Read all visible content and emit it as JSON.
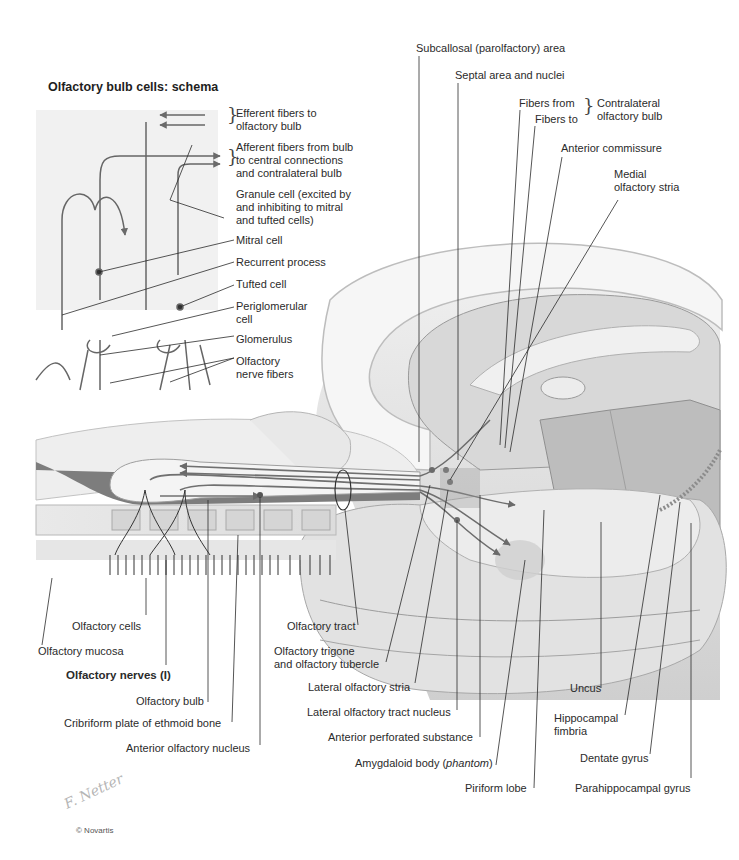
{
  "figure": {
    "inset_title": "Olfactory bulb cells: schema",
    "copyright": "© Novartis",
    "signature": "F. Netter",
    "colors": {
      "background": "#ffffff",
      "inset_panel": "#f1f1f1",
      "brain_light": "#e6e6e6",
      "brain_mid": "#c9c9c9",
      "brain_dark": "#8c8c8c",
      "fiber_gray": "#707070",
      "leader_line": "#2b2b2b"
    }
  },
  "inset_labels": {
    "efferent": [
      "Efferent fibers to",
      "olfactory bulb"
    ],
    "afferent": [
      "Afferent fibers from bulb",
      "to central connections",
      "and contralateral bulb"
    ],
    "granule": "Granule cell (excited by\nand inhibiting to mitral\nand tufted cells)",
    "mitral": "Mitral cell",
    "recurrent": "Recurrent process",
    "tufted": "Tufted cell",
    "periglomerular": "Periglomerular\ncell",
    "glomerulus": "Glomerulus",
    "nerve_fibers": "Olfactory\nnerve fibers"
  },
  "top_labels": {
    "subcallosal": "Subcallosal (parolfactory) area",
    "septal": "Septal area and nuclei",
    "fibers_from": "Fibers from",
    "fibers_to": "Fibers to",
    "contralateral": "Contralateral\nolfactory bulb",
    "anterior_commissure": "Anterior commissure",
    "medial_stria": "Medial\nolfactory stria"
  },
  "bottom_labels": {
    "olfactory_cells": "Olfactory cells",
    "olfactory_mucosa": "Olfactory mucosa",
    "olfactory_nerves": "Olfactory nerves (I)",
    "olfactory_bulb": "Olfactory bulb",
    "cribriform": "Cribriform plate of ethmoid bone",
    "anterior_nucleus": "Anterior olfactory nucleus",
    "olfactory_tract": "Olfactory tract",
    "trigone": "Olfactory trigone\nand olfactory tubercle",
    "lateral_stria": "Lateral olfactory stria",
    "lateral_tract_nucleus": "Lateral olfactory tract nucleus",
    "perforated": "Anterior perforated substance",
    "amygdaloid": "Amygdaloid body (",
    "amygdaloid_italic": "phantom",
    "amygdaloid_end": ")",
    "piriform": "Piriform lobe",
    "uncus": "Uncus",
    "fimbria": "Hippocampal\nfimbria",
    "dentate": "Dentate gyrus",
    "parahippocampal": "Parahippocampal gyrus"
  }
}
